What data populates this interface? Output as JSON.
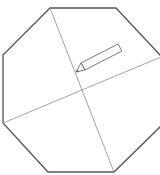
{
  "diagram": {
    "type": "octagon-with-diagonals",
    "colors": {
      "background": "#ffffff",
      "outline": "#555555",
      "diagonal": "#8a8a8a",
      "pencil": "#555555"
    },
    "octagon_points": "50,8 116,8 161,56 161,126 114,172 48,172 3,123 3,55",
    "diagonals": [
      {
        "x1": 50,
        "y1": 8,
        "x2": 114,
        "y2": 172
      },
      {
        "x1": 3,
        "y1": 123,
        "x2": 161,
        "y2": 57
      }
    ],
    "icons": [
      "pencil-icon"
    ]
  }
}
